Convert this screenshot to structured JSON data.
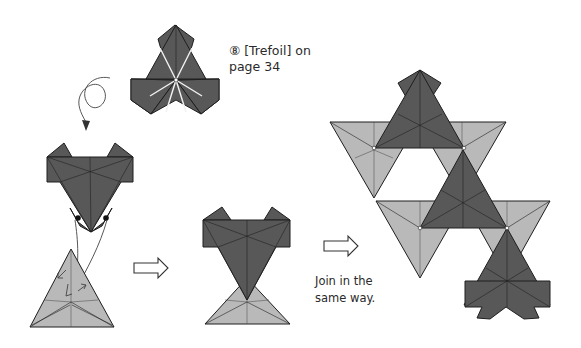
{
  "step_reference": {
    "number_symbol": "⑧",
    "line1": "⑧ [Trefoil] on",
    "line2": "page 34"
  },
  "instruction": {
    "line1": "Join in the",
    "line2": "same way."
  },
  "figures": [
    {
      "id": "trefoil-reference",
      "description": "Completed trefoil unit (dark)"
    },
    {
      "id": "turn-over",
      "description": "Looping arrow indicating turn over"
    },
    {
      "id": "insert-step",
      "description": "Dark unit inserted into light triangle unit"
    },
    {
      "id": "joined-pair",
      "description": "Dark unit joined with light unit"
    },
    {
      "id": "assembled-result",
      "description": "Multiple units joined into a larger arrangement"
    }
  ],
  "arrows": [
    {
      "id": "arrow-1",
      "type": "hollow-right"
    },
    {
      "id": "arrow-2",
      "type": "hollow-right"
    }
  ],
  "colors": {
    "dark_paper": "#585858",
    "light_paper": "#b9b9b9",
    "outline": "#1e1e1e",
    "background": "#ffffff",
    "text": "#2a2a2a"
  }
}
